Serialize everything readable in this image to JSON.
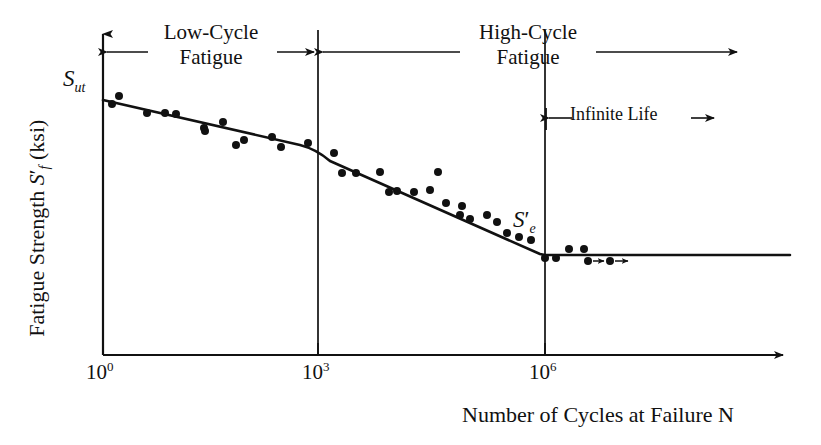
{
  "figure": {
    "background_color": "#ffffff",
    "ink_color": "#111111"
  },
  "labels": {
    "low_cycle_line1": "Low-Cycle",
    "low_cycle_line2": "Fatigue",
    "high_cycle_line1": "High-Cycle",
    "high_cycle_line2": "Fatigue",
    "infinite_life": "Infinite Life",
    "y_axis_title_part1": "Fatigue Strength ",
    "y_axis_title_symbol": "S",
    "y_axis_title_sub": "f",
    "y_axis_title_part2": " (ksi)",
    "x_axis_title": "Number of Cycles at Failure N",
    "sut_symbol": "S",
    "sut_sub": "ut",
    "se_symbol": "S",
    "se_sub": "e"
  },
  "chart_data": {
    "type": "scatter",
    "xlabel": "Number of Cycles at Failure N",
    "ylabel": "Fatigue Strength S'f (ksi)",
    "x_scale": "log10",
    "grid": false,
    "legend": false,
    "xtick_labels": [
      "10^0",
      "10^3",
      "10^6"
    ],
    "xtick_bases": [
      "10",
      "10",
      "10"
    ],
    "xtick_exponents": [
      "0",
      "3",
      "6"
    ],
    "xtick_log_values": [
      0,
      3,
      6
    ],
    "xlim_log": [
      0,
      8.4
    ],
    "ylim_note": "y-axis unlabeled; only S_ut (top) and S'_e (endurance limit) marked",
    "y_markers": [
      {
        "name": "S_ut",
        "label": "Sut",
        "description": "ultimate tensile strength at 10^0 cycles"
      },
      {
        "name": "S_e_prime",
        "label": "Se'",
        "description": "endurance limit at 10^6 cycles"
      }
    ],
    "regions": [
      {
        "name": "Low-Cycle Fatigue",
        "x_from_log": 0,
        "x_to_log": 3
      },
      {
        "name": "High-Cycle Fatigue",
        "x_from_log": 3,
        "x_to_log": 8.4
      },
      {
        "name": "Infinite Life",
        "x_from_log": 6,
        "x_to_log": 8.4
      }
    ],
    "trend_line": {
      "name": "S-N curve",
      "points_log_x": [
        0,
        3,
        6,
        8.4
      ],
      "points_px": [
        [
          103,
          100
        ],
        [
          318,
          150
        ],
        [
          545,
          255
        ],
        [
          790,
          255
        ]
      ],
      "description": "Piecewise: shallow decline through low-cycle fatigue, steeper decline through high-cycle fatigue, flat endurance limit beyond 10^6 cycles"
    },
    "points_px": [
      [
        112,
        104
      ],
      [
        119,
        96
      ],
      [
        147,
        113
      ],
      [
        165,
        113
      ],
      [
        176,
        114
      ],
      [
        204,
        128
      ],
      [
        205,
        131
      ],
      [
        223,
        122
      ],
      [
        244,
        140
      ],
      [
        236,
        145
      ],
      [
        272,
        137
      ],
      [
        281,
        147
      ],
      [
        308,
        143
      ],
      [
        334,
        153
      ],
      [
        342,
        173
      ],
      [
        356,
        173
      ],
      [
        380,
        172
      ],
      [
        389,
        192
      ],
      [
        397,
        191
      ],
      [
        414,
        192
      ],
      [
        430,
        190
      ],
      [
        446,
        203
      ],
      [
        460,
        215
      ],
      [
        438,
        172
      ],
      [
        462,
        206
      ],
      [
        470,
        219
      ],
      [
        487,
        215
      ],
      [
        497,
        222
      ],
      [
        507,
        233
      ],
      [
        519,
        237
      ],
      [
        531,
        240
      ],
      [
        545,
        258
      ],
      [
        556,
        258
      ],
      [
        569,
        249
      ],
      [
        584,
        249
      ],
      [
        588,
        261
      ],
      [
        610,
        261
      ]
    ],
    "runout_points_px": [
      {
        "x": 588,
        "y": 261,
        "arrow_to_x": 604
      },
      {
        "x": 610,
        "y": 261,
        "arrow_to_x": 628
      }
    ],
    "marker_style": "filled circle",
    "marker_color": "#111111",
    "marker_radius_px": 4
  },
  "geometry": {
    "y_axis_x": 103,
    "x_axis_y": 355,
    "divider_1e3_x": 318,
    "divider_1e6_x": 545,
    "x_axis_arrow_end_x": 790,
    "y_axis_arrow_top_y": 28,
    "region_arrow_y": 52,
    "infinite_life_arrow_y": 118
  }
}
